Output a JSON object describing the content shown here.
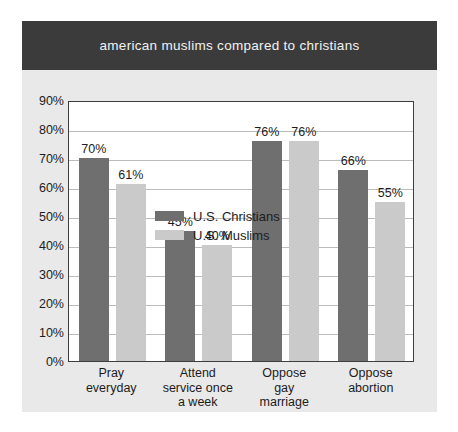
{
  "header": {
    "title": "american muslims compared to christians"
  },
  "colors": {
    "title_band": "#3b3b3b",
    "title_text": "#f2f2f2",
    "card_background": "#e9e9e9",
    "plot_background": "#ffffff",
    "axis_line": "#3d3d3d",
    "gridline": "#bcbcbc",
    "christians_bar": "#6f6f6f",
    "muslims_bar": "#cacaca",
    "text": "#1c1c1c"
  },
  "legend": {
    "position": "top-left-inside-plot",
    "entries": [
      {
        "label": "U.S. Christians",
        "color": "#6f6f6f"
      },
      {
        "label": "U.S. Muslims",
        "color": "#cacaca"
      }
    ]
  },
  "chart_data": {
    "type": "bar",
    "title": "american muslims compared to christians",
    "xlabel": "",
    "ylabel": "",
    "ylim": [
      0,
      90
    ],
    "ytick_labels": [
      "90%",
      "80%",
      "70%",
      "60%",
      "50%",
      "40%",
      "30%",
      "20%",
      "10%",
      "0%"
    ],
    "ytick_values": [
      90,
      80,
      70,
      60,
      50,
      40,
      30,
      20,
      10,
      0
    ],
    "grid": true,
    "legend_position": "upper left",
    "categories": [
      "Pray everyday",
      "Attend service once a week",
      "Oppose gay marriage",
      "Oppose abortion"
    ],
    "category_lines": [
      [
        "Pray",
        "everyday"
      ],
      [
        "Attend",
        "service once",
        "a week"
      ],
      [
        "Oppose",
        "gay",
        "marriage"
      ],
      [
        "Oppose",
        "abortion"
      ]
    ],
    "series": [
      {
        "name": "U.S. Christians",
        "color": "#6f6f6f",
        "values": [
          70,
          45,
          76,
          66
        ],
        "labels": [
          "70%",
          "45%",
          "76%",
          "66%"
        ]
      },
      {
        "name": "U.S. Muslims",
        "color": "#cacaca",
        "values": [
          61,
          40,
          76,
          55
        ],
        "labels": [
          "61%",
          "40%",
          "76%",
          "55%"
        ]
      }
    ]
  }
}
